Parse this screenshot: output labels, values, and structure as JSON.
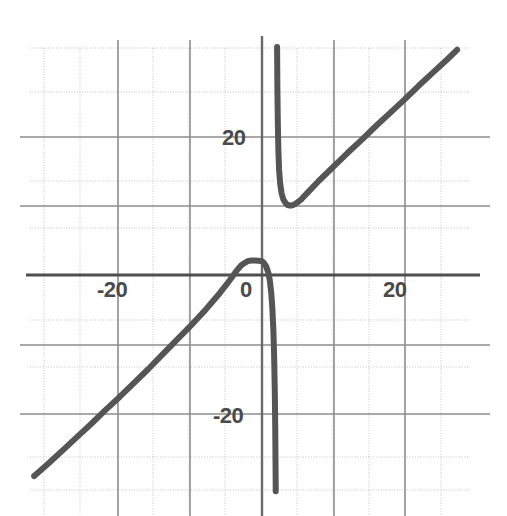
{
  "chart": {
    "title": "",
    "subtitle": "",
    "background_color": "#ffffff",
    "curve_color": "#555555",
    "axis_color": "#666666",
    "major_grid_color": "#999999",
    "minor_grid_color": "#bbbbbb",
    "label_color": "#4a4a4a"
  },
  "axes": {
    "x_label": "",
    "y_label": "",
    "x_tick_labels": [
      "-20",
      "0",
      "20"
    ],
    "y_tick_labels": [
      "20",
      "-20"
    ],
    "x_ticks": [
      -20,
      0,
      20
    ],
    "y_ticks": [
      20,
      -20
    ],
    "xlim": [
      -32.3,
      29.5
    ],
    "ylim": [
      -31.2,
      32.9
    ],
    "grid": true,
    "major_grid_step": 10,
    "minor_grid_step": 5,
    "legend": "none"
  },
  "chart_data": {
    "type": "line",
    "title": "",
    "xlabel": "",
    "ylabel": "",
    "xlim": [
      -32.3,
      29.5
    ],
    "ylim": [
      -31.2,
      32.9
    ],
    "grid": true,
    "legend_position": "none",
    "x_ticks": [
      -20,
      0,
      20
    ],
    "y_ticks": [
      20,
      -20
    ],
    "x_tick_labels": [
      "-20",
      "0",
      "20"
    ],
    "y_tick_labels": [
      "20",
      "-20"
    ],
    "vertical_asymptote": 2,
    "oblique_asymptote": "y = x",
    "local_maximum": [
      0,
      2
    ],
    "local_minimum": [
      4,
      10
    ],
    "series": [
      {
        "name": "left-branch",
        "points": [
          [
            -32.0,
            -29.0
          ],
          [
            -30.0,
            -27.2
          ],
          [
            -28.0,
            -25.3
          ],
          [
            -26.0,
            -23.4
          ],
          [
            -24.0,
            -21.5
          ],
          [
            -22.0,
            -19.5
          ],
          [
            -20.0,
            -17.6
          ],
          [
            -18.0,
            -15.6
          ],
          [
            -16.0,
            -13.6
          ],
          [
            -14.0,
            -11.5
          ],
          [
            -12.0,
            -9.4
          ],
          [
            -10.0,
            -7.3
          ],
          [
            -9.0,
            -6.2
          ],
          [
            -8.0,
            -5.1
          ],
          [
            -7.0,
            -3.9
          ],
          [
            -6.0,
            -2.7
          ],
          [
            -5.0,
            -1.4
          ],
          [
            -4.0,
            0.0
          ],
          [
            -3.5,
            0.7
          ],
          [
            -3.0,
            1.3
          ],
          [
            -2.5,
            1.7
          ],
          [
            -2.0,
            2.0
          ],
          [
            -1.5,
            2.1
          ],
          [
            -1.0,
            2.1
          ],
          [
            -0.5,
            2.05
          ],
          [
            0.0,
            2.0
          ],
          [
            0.3,
            1.7
          ],
          [
            0.6,
            1.2
          ],
          [
            0.9,
            0.3
          ],
          [
            1.1,
            -0.8
          ],
          [
            1.3,
            -2.6
          ],
          [
            1.45,
            -4.7
          ],
          [
            1.6,
            -8.0
          ],
          [
            1.7,
            -11.5
          ],
          [
            1.8,
            -17.0
          ],
          [
            1.86,
            -22.0
          ],
          [
            1.9,
            -27.0
          ],
          [
            1.93,
            -31.2
          ]
        ]
      },
      {
        "name": "right-branch",
        "points": [
          [
            2.12,
            32.9
          ],
          [
            2.16,
            27.0
          ],
          [
            2.22,
            22.0
          ],
          [
            2.3,
            18.0
          ],
          [
            2.4,
            15.2
          ],
          [
            2.55,
            13.2
          ],
          [
            2.75,
            11.8
          ],
          [
            3.0,
            10.9
          ],
          [
            3.3,
            10.4
          ],
          [
            3.6,
            10.1
          ],
          [
            4.0,
            10.0
          ],
          [
            4.4,
            10.1
          ],
          [
            4.9,
            10.4
          ],
          [
            5.5,
            10.9
          ],
          [
            6.5,
            12.0
          ],
          [
            8.0,
            13.6
          ],
          [
            10.0,
            15.6
          ],
          [
            12.0,
            17.6
          ],
          [
            14.0,
            19.5
          ],
          [
            16.0,
            21.5
          ],
          [
            18.0,
            23.4
          ],
          [
            20.0,
            25.3
          ],
          [
            22.0,
            27.3
          ],
          [
            24.0,
            29.2
          ],
          [
            26.0,
            31.1
          ],
          [
            27.4,
            32.5
          ]
        ]
      }
    ]
  },
  "labels": {
    "x_neg20": "-20",
    "x_zero": "0",
    "x_pos20": "20",
    "y_pos20": "20",
    "y_neg20": "-20"
  }
}
